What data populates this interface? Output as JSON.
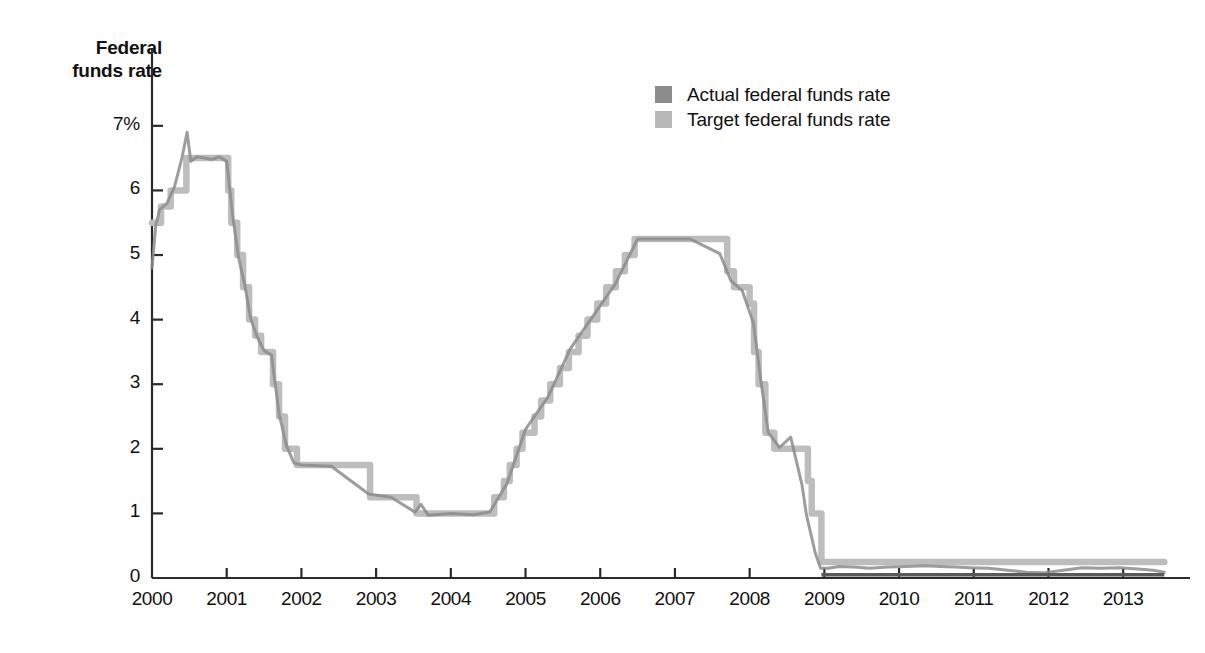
{
  "axis_title": "Federal\nfunds rate",
  "legend": {
    "position": "top-center-right",
    "items": [
      {
        "label": "Actual federal funds rate",
        "color": "#8c8c8c",
        "series": "actual"
      },
      {
        "label": "Target federal funds rate",
        "color": "#b9b9b9",
        "series": "target"
      }
    ]
  },
  "colors": {
    "actual": "#8c8c8c",
    "target": "#bdbdbd",
    "axis": "#2b2b2b",
    "text": "#111111",
    "background": "#ffffff"
  },
  "chart_data": {
    "type": "line",
    "title": "",
    "subtitle": "",
    "xlabel": "",
    "ylabel": "Federal funds rate",
    "grid": false,
    "legend_position": "top-right",
    "xlim": [
      2000.0,
      2013.6
    ],
    "ylim": [
      0,
      7.4
    ],
    "yticks": [
      0,
      1,
      2,
      3,
      4,
      5,
      6,
      7
    ],
    "ytick_labels": [
      "0",
      "1",
      "2",
      "3",
      "4",
      "5",
      "6",
      "7%"
    ],
    "xticks": [
      2000,
      2001,
      2002,
      2003,
      2004,
      2005,
      2006,
      2007,
      2008,
      2009,
      2010,
      2011,
      2012,
      2013
    ],
    "xtick_labels": [
      "2000",
      "2001",
      "2002",
      "2003",
      "2004",
      "2005",
      "2006",
      "2007",
      "2008",
      "2009",
      "2010",
      "2011",
      "2012",
      "2013"
    ],
    "series": [
      {
        "name": "Target federal funds rate",
        "color": "#bdbdbd",
        "style": "step",
        "x": [
          2000.0,
          2000.12,
          2000.21,
          2000.25,
          2000.38,
          2000.46,
          2000.5,
          2001.0,
          2001.02,
          2001.06,
          2001.14,
          2001.22,
          2001.3,
          2001.38,
          2001.46,
          2001.54,
          2001.62,
          2001.7,
          2001.78,
          2001.86,
          2001.94,
          2002.0,
          2002.88,
          2002.92,
          2003.0,
          2003.5,
          2003.54,
          2004.0,
          2004.49,
          2004.58,
          2004.71,
          2004.79,
          2004.88,
          2004.96,
          2005.12,
          2005.21,
          2005.33,
          2005.46,
          2005.58,
          2005.71,
          2005.83,
          2005.96,
          2006.08,
          2006.21,
          2006.33,
          2006.46,
          2006.54,
          2007.0,
          2007.7,
          2007.79,
          2007.88,
          2008.0,
          2008.06,
          2008.12,
          2008.21,
          2008.33,
          2008.71,
          2008.78,
          2008.83,
          2008.96,
          2009.0,
          2010.0,
          2011.0,
          2012.0,
          2013.0,
          2013.55
        ],
        "y": [
          5.5,
          5.75,
          5.75,
          6.0,
          6.0,
          6.5,
          6.5,
          6.5,
          6.0,
          5.5,
          5.0,
          4.5,
          4.0,
          3.75,
          3.5,
          3.5,
          3.0,
          2.5,
          2.0,
          2.0,
          1.75,
          1.75,
          1.75,
          1.25,
          1.25,
          1.25,
          1.0,
          1.0,
          1.0,
          1.25,
          1.5,
          1.75,
          2.0,
          2.25,
          2.5,
          2.75,
          3.0,
          3.25,
          3.5,
          3.75,
          4.0,
          4.25,
          4.5,
          4.75,
          5.0,
          5.25,
          5.25,
          5.25,
          4.75,
          4.5,
          4.5,
          4.25,
          3.5,
          3.0,
          2.25,
          2.0,
          2.0,
          1.5,
          1.0,
          0.25,
          0.25,
          0.25,
          0.25,
          0.25,
          0.25,
          0.25
        ],
        "note": "Step-function policy target; 6.5% plateau 2000-2001, 1.0% trough 2003-2004, 5.25% plateau 2006-2007, 0-0.25% from Dec 2008"
      },
      {
        "name": "Actual federal funds rate",
        "color": "#8c8c8c",
        "style": "line",
        "x": [
          2000.0,
          2000.05,
          2000.1,
          2000.2,
          2000.3,
          2000.4,
          2000.47,
          2000.52,
          2000.6,
          2000.7,
          2000.8,
          2000.9,
          2001.0,
          2001.08,
          2001.16,
          2001.24,
          2001.32,
          2001.4,
          2001.5,
          2001.6,
          2001.7,
          2001.8,
          2001.9,
          2002.0,
          2002.4,
          2002.9,
          2003.2,
          2003.52,
          2003.6,
          2003.7,
          2004.0,
          2004.3,
          2004.52,
          2004.75,
          2005.0,
          2005.3,
          2005.6,
          2005.9,
          2006.2,
          2006.5,
          2006.8,
          2007.2,
          2007.6,
          2007.75,
          2007.9,
          2008.05,
          2008.15,
          2008.25,
          2008.4,
          2008.55,
          2008.7,
          2008.76,
          2008.8,
          2008.88,
          2008.95,
          2009.05,
          2009.2,
          2009.4,
          2009.6,
          2009.85,
          2010.1,
          2010.35,
          2010.55,
          2010.75,
          2010.95,
          2011.2,
          2011.45,
          2011.7,
          2011.95,
          2012.2,
          2012.45,
          2012.7,
          2012.95,
          2013.2,
          2013.4,
          2013.55
        ],
        "y": [
          4.8,
          5.45,
          5.7,
          5.8,
          6.05,
          6.5,
          6.9,
          6.45,
          6.52,
          6.5,
          6.48,
          6.52,
          6.45,
          5.6,
          4.95,
          4.55,
          4.02,
          3.75,
          3.52,
          3.45,
          2.55,
          2.05,
          1.78,
          1.75,
          1.73,
          1.3,
          1.25,
          1.02,
          1.14,
          0.97,
          1.0,
          0.98,
          1.02,
          1.46,
          2.3,
          2.8,
          3.55,
          4.05,
          4.55,
          5.25,
          5.25,
          5.25,
          5.02,
          4.6,
          4.45,
          3.95,
          3.05,
          2.25,
          2.02,
          2.18,
          1.45,
          0.98,
          0.78,
          0.38,
          0.15,
          0.15,
          0.18,
          0.17,
          0.15,
          0.17,
          0.18,
          0.19,
          0.18,
          0.17,
          0.16,
          0.15,
          0.12,
          0.09,
          0.08,
          0.12,
          0.16,
          0.15,
          0.16,
          0.14,
          0.12,
          0.09
        ],
        "note": "Effective market rate tracking the target with intraday/daily volatility"
      }
    ]
  }
}
